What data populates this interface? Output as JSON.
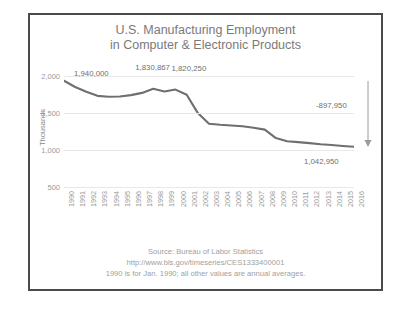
{
  "chart_data": {
    "type": "line",
    "title": "U.S.  Manufacturing Employment",
    "subtitle": "in Computer & Electronic Products",
    "xlabel": "",
    "ylabel": "Thousands",
    "ylim": [
      250,
      2100
    ],
    "yticks": [
      "500",
      "1,000",
      "1,500",
      "2,000"
    ],
    "ytick_values": [
      500,
      1000,
      1500,
      2000
    ],
    "grid": true,
    "legend": "none",
    "categories": [
      "1990",
      "1991",
      "1992",
      "1993",
      "1994",
      "1995",
      "1996",
      "1997",
      "1998",
      "1999",
      "2000",
      "2001",
      "2002",
      "2003",
      "2004",
      "2005",
      "2006",
      "2007",
      "2008",
      "2009",
      "2010",
      "2011",
      "2012",
      "2013",
      "2014",
      "2015",
      "2016"
    ],
    "values": [
      1940,
      1855,
      1790,
      1735,
      1722,
      1725,
      1745,
      1775,
      1831,
      1795,
      1820,
      1749,
      1500,
      1355,
      1341,
      1332,
      1321,
      1301,
      1275,
      1160,
      1117,
      1105,
      1092,
      1076,
      1066,
      1053,
      1043
    ],
    "units": "thousands of jobs",
    "annotations": [
      {
        "name": "start-value",
        "label": "1,940,000",
        "category": "1990",
        "value": 1940
      },
      {
        "name": "peak-1998",
        "label": "1,830,867",
        "category": "1998",
        "value": 1831
      },
      {
        "name": "peak-2000",
        "label": "1,820,250",
        "category": "2000",
        "value": 1820
      },
      {
        "name": "end-value",
        "label": "1,042,950",
        "category": "2016",
        "value": 1043
      },
      {
        "name": "net-change",
        "label": "-897,950",
        "value": -898
      }
    ]
  },
  "footer": {
    "source": "Source: Bureau of Labor Statistics",
    "url": "http://www.bls.gov/timeseries/CES1333400001",
    "note": "1990 is for Jan. 1990; all other values are annual averages."
  },
  "colors": {
    "line": "#6f6f6f",
    "grid": "#e8e8e8",
    "text": "#9a9a9a",
    "title": "#7a7a7a",
    "border": "#4a4a4a"
  }
}
